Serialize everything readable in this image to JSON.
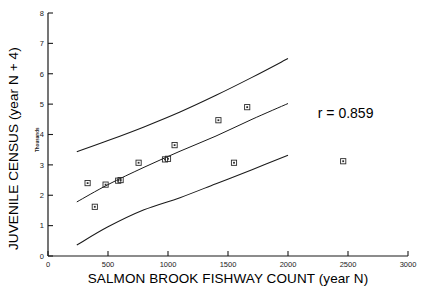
{
  "chart_data": {
    "type": "scatter",
    "title": "",
    "xlabel": "SALMON BROOK FISHWAY COUNT (year N)",
    "ylabel": "JUVENILE CENSUS (year N + 4)",
    "y_unit_label": "Thousands",
    "xlim": [
      0,
      3000
    ],
    "ylim": [
      0,
      8
    ],
    "xticks": [
      "0",
      "500",
      "1000",
      "1500",
      "2000",
      "2500",
      "3000"
    ],
    "xtick_values": [
      0,
      500,
      1000,
      1500,
      2000,
      2500,
      3000
    ],
    "yticks": [
      "0",
      "1",
      "2",
      "3",
      "4",
      "5",
      "6",
      "7",
      "8"
    ],
    "ytick_values": [
      0,
      1,
      2,
      3,
      4,
      5,
      6,
      7,
      8
    ],
    "grid": false,
    "legend": false,
    "annotations": [
      {
        "text": "r = 0.859",
        "x": 2480,
        "y": 4.55
      }
    ],
    "points": [
      {
        "x": 330,
        "y": 2.4
      },
      {
        "x": 390,
        "y": 1.62
      },
      {
        "x": 480,
        "y": 2.35
      },
      {
        "x": 585,
        "y": 2.48
      },
      {
        "x": 605,
        "y": 2.5
      },
      {
        "x": 755,
        "y": 3.07
      },
      {
        "x": 975,
        "y": 3.18
      },
      {
        "x": 1000,
        "y": 3.2
      },
      {
        "x": 1055,
        "y": 3.65
      },
      {
        "x": 1420,
        "y": 4.47
      },
      {
        "x": 1550,
        "y": 3.07
      },
      {
        "x": 1660,
        "y": 4.9
      },
      {
        "x": 2460,
        "y": 3.12
      }
    ],
    "series": [
      {
        "name": "regression-line",
        "x": [
          240,
          500,
          800,
          1100,
          1400,
          1700,
          2000
        ],
        "values": [
          1.78,
          2.35,
          2.92,
          3.45,
          3.95,
          4.5,
          5.02
        ]
      },
      {
        "name": "upper-confidence-band",
        "x": [
          240,
          500,
          800,
          1100,
          1400,
          1700,
          2000
        ],
        "values": [
          3.43,
          3.8,
          4.25,
          4.74,
          5.29,
          5.88,
          6.5
        ]
      },
      {
        "name": "lower-confidence-band",
        "x": [
          240,
          500,
          800,
          1100,
          1400,
          1700,
          2000
        ],
        "values": [
          0.36,
          0.96,
          1.52,
          1.92,
          2.38,
          2.84,
          3.32
        ]
      }
    ],
    "colors": {
      "axis": "#1a1a1a",
      "curve": "#1a1a1a",
      "marker": "#2b2b2b",
      "background": "#ffffff"
    }
  }
}
